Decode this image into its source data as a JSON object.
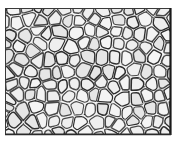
{
  "figure": {
    "name": "micrograph-panel",
    "type": "micrograph",
    "width_px": 177,
    "height_px": 143,
    "alt_text": "Cellular grain microstructure"
  },
  "frame": {
    "name": "image-frame",
    "x": 5,
    "y": 8,
    "width": 166,
    "height": 127,
    "stroke": "#3a3a3a",
    "stroke_width": 1,
    "right_edge_stroke": "#1a1a1a",
    "right_edge_width": 2.2,
    "bottom_edge_stroke": "#2b2b2b",
    "bottom_edge_width": 1.6
  },
  "colors": {
    "background": "#ffffff",
    "page": "#fdfdfd",
    "grain_fill": "#f4f4f4",
    "grain_fill_alt": "#efefef",
    "grain_fill_dark": "#e6e6e6",
    "boundary": "#4a4a4a",
    "boundary_dark": "#2e2e2e",
    "speckle": "#9a9a9a"
  },
  "grid": {
    "seed": 20240517,
    "cols": 13,
    "rows": 10,
    "jitter": 0.34,
    "boundary_width": 1.35,
    "cell_count_estimate": 150
  },
  "labels": {
    "none": ""
  }
}
